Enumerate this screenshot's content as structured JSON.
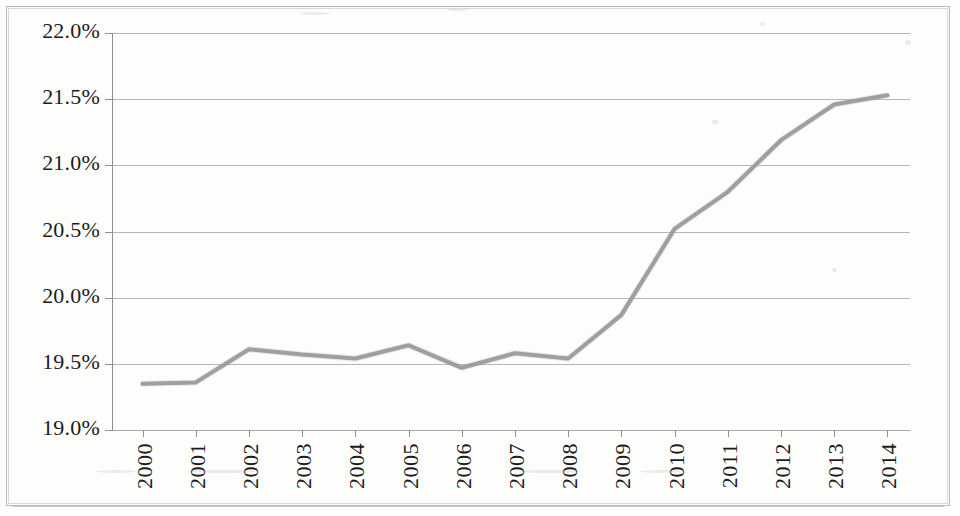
{
  "chart_data": {
    "type": "line",
    "title": "",
    "subtitle": "",
    "xlabel": "",
    "ylabel": "",
    "categories": [
      "2000",
      "2001",
      "2002",
      "2003",
      "2004",
      "2005",
      "2006",
      "2007",
      "2008",
      "2009",
      "2010",
      "2011",
      "2012",
      "2013",
      "2014"
    ],
    "series": [
      {
        "name": "Series 1",
        "color": "#8c8c8c",
        "values": [
          19.35,
          19.36,
          19.61,
          19.57,
          19.54,
          19.64,
          19.47,
          19.58,
          19.54,
          19.87,
          20.52,
          20.8,
          21.19,
          21.46,
          21.53
        ]
      }
    ],
    "ylim": [
      19.0,
      22.0
    ],
    "ytick_values": [
      22.0,
      21.5,
      21.0,
      20.5,
      20.0,
      19.5,
      19.0
    ],
    "ytick_labels": [
      "22.0%",
      "21.5%",
      "21.0%",
      "20.5%",
      "20.0%",
      "19.5%",
      "19.0%"
    ],
    "xtick_labels": [
      "2000",
      "2001",
      "2002",
      "2003",
      "2004",
      "2005",
      "2006",
      "2007",
      "2008",
      "2009",
      "2010",
      "2011",
      "2012",
      "2013",
      "2014"
    ],
    "xtick_rotation": 90,
    "grid": {
      "horizontal": true,
      "vertical": false
    },
    "legend": {
      "visible": false,
      "position": "none"
    },
    "value_format": "percent",
    "line_width_px": 4,
    "marker": "none"
  },
  "axes": {
    "y_axis_name": "percent-axis",
    "x_axis_name": "year-axis"
  },
  "style": {
    "line_color": "#8c8c8c",
    "grid_color": "#a9a9a9",
    "axis_color": "#8f8f8f",
    "text_color": "#1c1c1c",
    "background": "#fdfdfc",
    "frame_color": "#b9b9b9"
  }
}
